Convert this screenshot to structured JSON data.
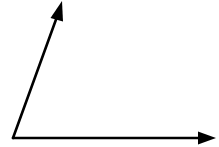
{
  "diagram": {
    "type": "angle",
    "stroke_color": "#000000",
    "background_color": "#ffffff",
    "vertex": {
      "x": 13,
      "y": 138
    },
    "rays": [
      {
        "name": "horizontal-ray",
        "end": {
          "x": 215,
          "y": 138
        },
        "direction": "right"
      },
      {
        "name": "slanted-ray",
        "end": {
          "x": 62,
          "y": 2
        },
        "direction": "up-right"
      }
    ]
  }
}
